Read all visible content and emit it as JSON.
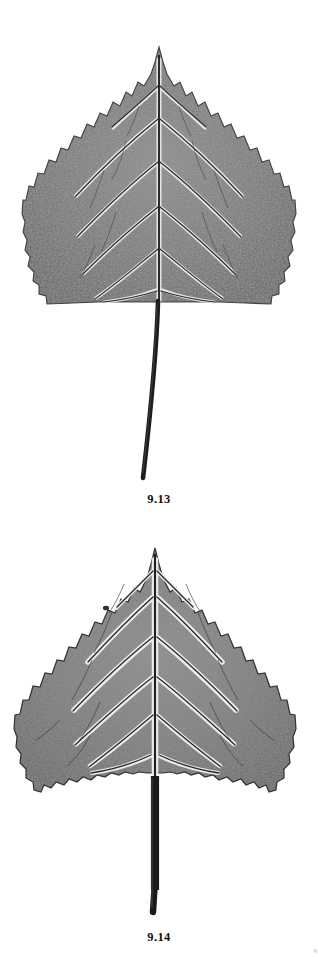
{
  "plate": {
    "kind": "botanical-specimen-plate",
    "background_color": "#ffffff",
    "ink_color": "#2b2b2b",
    "page_width": 318,
    "page_height": 957
  },
  "figures": [
    {
      "id": "9.13",
      "caption": "9.13",
      "subject": "leaf-specimen",
      "leaf_shape": "deltoid",
      "margin": "crenate-serrate",
      "apex": "acuminate",
      "base": "truncate",
      "venation": "pinnate",
      "petiole": "long-slender-curved",
      "orientation": "apex-up",
      "tone": "grayscale-halftone"
    },
    {
      "id": "9.14",
      "caption": "9.14",
      "subject": "leaf-specimen",
      "leaf_shape": "deltoid",
      "margin": "crenate-serrate",
      "apex": "acuminate",
      "base": "truncate",
      "venation": "pinnate",
      "petiole": "short-stout-straight",
      "orientation": "apex-up",
      "tone": "grayscale-halftone"
    }
  ],
  "corner_mark": {
    "text": "9",
    "visible": true
  }
}
